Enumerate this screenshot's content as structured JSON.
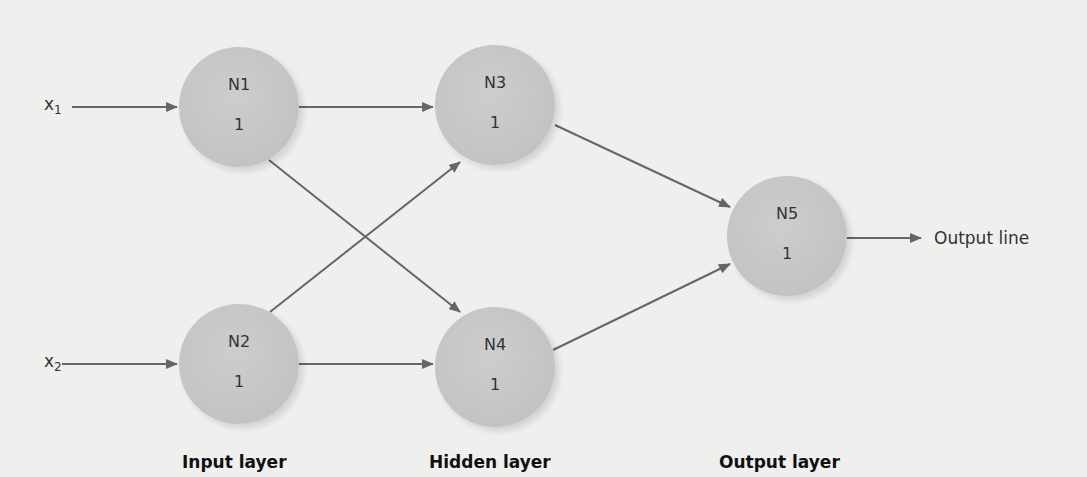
{
  "diagram": {
    "inputs": [
      {
        "label": "x",
        "sub": "1"
      },
      {
        "label": "x",
        "sub": "2"
      }
    ],
    "nodes": [
      {
        "id": "N1",
        "value": "1"
      },
      {
        "id": "N2",
        "value": "1"
      },
      {
        "id": "N3",
        "value": "1"
      },
      {
        "id": "N4",
        "value": "1"
      },
      {
        "id": "N5",
        "value": "1"
      }
    ],
    "output_label": "Output line",
    "layers": [
      "Input layer",
      "Hidden layer",
      "Output layer"
    ],
    "colors": {
      "background": "#efefed",
      "node": "#c6c6c6",
      "arrow": "#666666",
      "text": "#333333"
    }
  }
}
